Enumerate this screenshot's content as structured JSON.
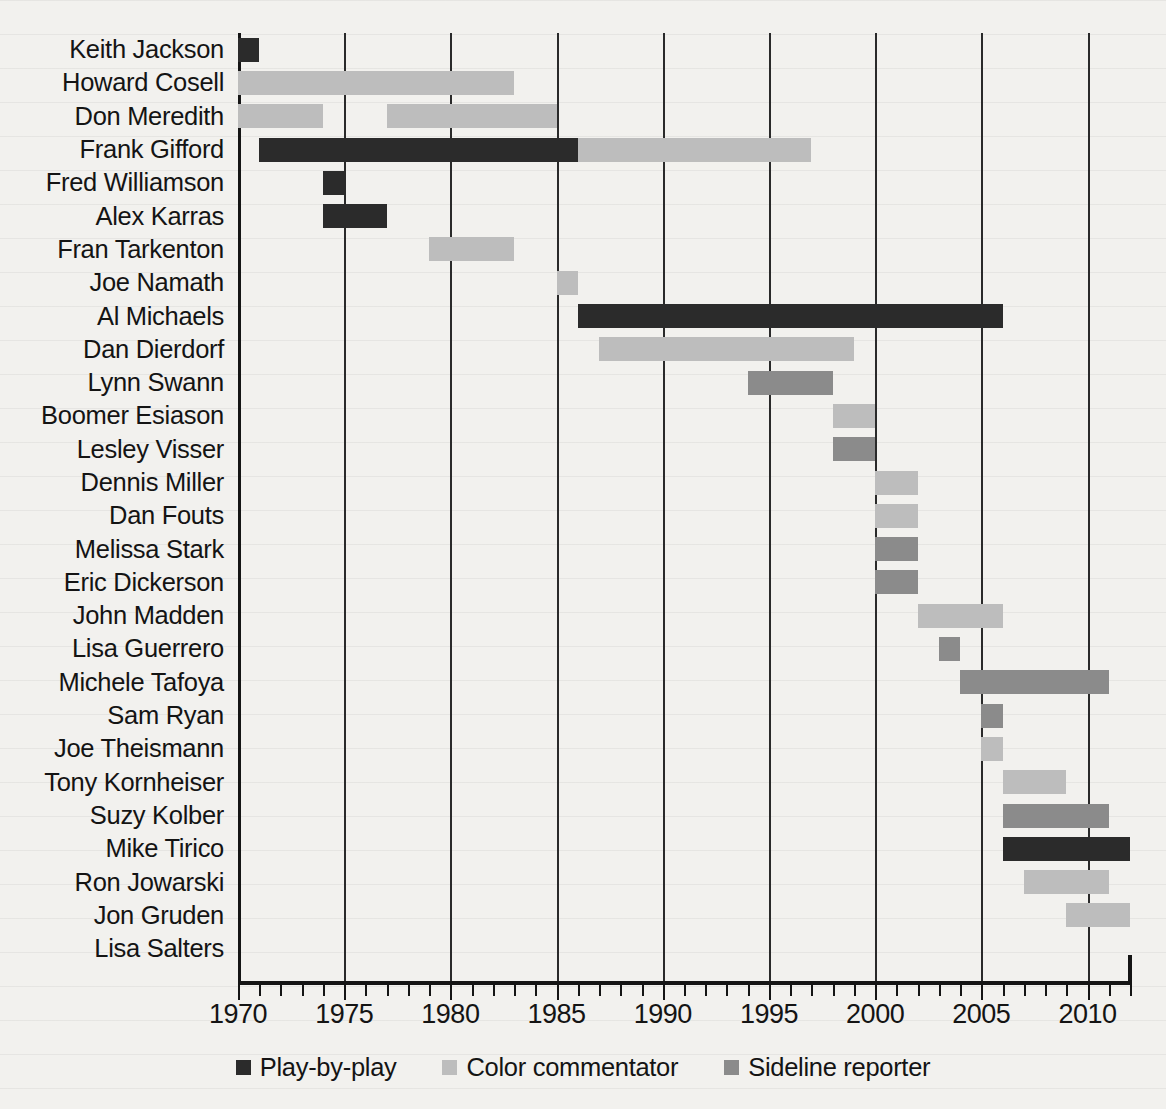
{
  "chart_data": {
    "type": "bar",
    "title": "",
    "subtitle": "",
    "xlabel": "",
    "ylabel": "",
    "xlim": [
      1970,
      2012
    ],
    "xticks": [
      1970,
      1975,
      1980,
      1985,
      1990,
      1995,
      2000,
      2005,
      2010
    ],
    "xtick_labels": [
      "1970",
      "1975",
      "1980",
      "1985",
      "1990",
      "1995",
      "2000",
      "2005",
      "2010"
    ],
    "minor_tick_step": 1,
    "grid": "vertical-at-major-ticks",
    "legend_position": "bottom-center",
    "legend": [
      {
        "key": "pbp",
        "label": "Play-by-play",
        "color": "#2b2b2b"
      },
      {
        "key": "color",
        "label": "Color commentator",
        "color": "#bdbdbd"
      },
      {
        "key": "sideline",
        "label": "Sideline reporter",
        "color": "#8b8b8b"
      }
    ],
    "categories": [
      "Keith Jackson",
      "Howard Cosell",
      "Don Meredith",
      "Frank Gifford",
      "Fred Williamson",
      "Alex Karras",
      "Fran Tarkenton",
      "Joe Namath",
      "Al Michaels",
      "Dan Dierdorf",
      "Lynn Swann",
      "Boomer Esiason",
      "Lesley Visser",
      "Dennis Miller",
      "Dan Fouts",
      "Melissa Stark",
      "Eric Dickerson",
      "John Madden",
      "Lisa Guerrero",
      "Michele Tafoya",
      "Sam Ryan",
      "Joe Theismann",
      "Tony Kornheiser",
      "Suzy Kolber",
      "Mike Tirico",
      "Ron Jowarski",
      "Jon Gruden",
      "Lisa Salters"
    ],
    "rows": [
      {
        "name": "Keith Jackson",
        "spans": [
          {
            "role": "pbp",
            "start": 1970,
            "end": 1971
          }
        ]
      },
      {
        "name": "Howard Cosell",
        "spans": [
          {
            "role": "color",
            "start": 1970,
            "end": 1983
          }
        ]
      },
      {
        "name": "Don Meredith",
        "spans": [
          {
            "role": "color",
            "start": 1970,
            "end": 1974
          },
          {
            "role": "color",
            "start": 1977,
            "end": 1985
          }
        ]
      },
      {
        "name": "Frank Gifford",
        "spans": [
          {
            "role": "pbp",
            "start": 1971,
            "end": 1986
          },
          {
            "role": "color",
            "start": 1986,
            "end": 1997
          }
        ]
      },
      {
        "name": "Fred Williamson",
        "spans": [
          {
            "role": "pbp",
            "start": 1974,
            "end": 1975
          }
        ]
      },
      {
        "name": "Alex Karras",
        "spans": [
          {
            "role": "pbp",
            "start": 1974,
            "end": 1977
          }
        ]
      },
      {
        "name": "Fran Tarkenton",
        "spans": [
          {
            "role": "color",
            "start": 1979,
            "end": 1983
          }
        ]
      },
      {
        "name": "Joe Namath",
        "spans": [
          {
            "role": "color",
            "start": 1985,
            "end": 1986
          }
        ]
      },
      {
        "name": "Al Michaels",
        "spans": [
          {
            "role": "pbp",
            "start": 1986,
            "end": 2006
          }
        ]
      },
      {
        "name": "Dan Dierdorf",
        "spans": [
          {
            "role": "color",
            "start": 1987,
            "end": 1999
          }
        ]
      },
      {
        "name": "Lynn Swann",
        "spans": [
          {
            "role": "sideline",
            "start": 1994,
            "end": 1998
          }
        ]
      },
      {
        "name": "Boomer Esiason",
        "spans": [
          {
            "role": "color",
            "start": 1998,
            "end": 2000
          }
        ]
      },
      {
        "name": "Lesley Visser",
        "spans": [
          {
            "role": "sideline",
            "start": 1998,
            "end": 2000
          }
        ]
      },
      {
        "name": "Dennis Miller",
        "spans": [
          {
            "role": "color",
            "start": 2000,
            "end": 2002
          }
        ]
      },
      {
        "name": "Dan Fouts",
        "spans": [
          {
            "role": "color",
            "start": 2000,
            "end": 2002
          }
        ]
      },
      {
        "name": "Melissa Stark",
        "spans": [
          {
            "role": "sideline",
            "start": 2000,
            "end": 2002
          }
        ]
      },
      {
        "name": "Eric Dickerson",
        "spans": [
          {
            "role": "sideline",
            "start": 2000,
            "end": 2002
          }
        ]
      },
      {
        "name": "John Madden",
        "spans": [
          {
            "role": "color",
            "start": 2002,
            "end": 2006
          }
        ]
      },
      {
        "name": "Lisa Guerrero",
        "spans": [
          {
            "role": "sideline",
            "start": 2003,
            "end": 2004
          }
        ]
      },
      {
        "name": "Michele Tafoya",
        "spans": [
          {
            "role": "sideline",
            "start": 2004,
            "end": 2011
          }
        ]
      },
      {
        "name": "Sam Ryan",
        "spans": [
          {
            "role": "sideline",
            "start": 2005,
            "end": 2006
          }
        ]
      },
      {
        "name": "Joe Theismann",
        "spans": [
          {
            "role": "color",
            "start": 2005,
            "end": 2006
          }
        ]
      },
      {
        "name": "Tony Kornheiser",
        "spans": [
          {
            "role": "color",
            "start": 2006,
            "end": 2009
          }
        ]
      },
      {
        "name": "Suzy Kolber",
        "spans": [
          {
            "role": "sideline",
            "start": 2006,
            "end": 2011
          }
        ]
      },
      {
        "name": "Mike Tirico",
        "spans": [
          {
            "role": "pbp",
            "start": 2006,
            "end": 2012
          }
        ]
      },
      {
        "name": "Ron Jowarski",
        "spans": [
          {
            "role": "color",
            "start": 2007,
            "end": 2011
          }
        ]
      },
      {
        "name": "Jon Gruden",
        "spans": [
          {
            "role": "color",
            "start": 2009,
            "end": 2012
          }
        ]
      },
      {
        "name": "Lisa Salters",
        "spans": []
      }
    ]
  }
}
